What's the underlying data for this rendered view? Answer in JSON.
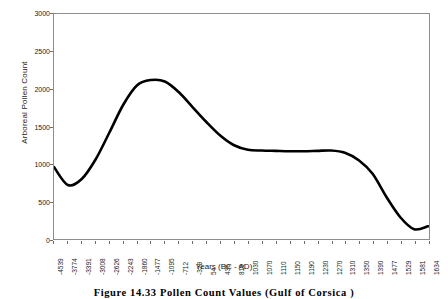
{
  "chart_data": {
    "type": "line",
    "title": "",
    "xlabel": "Years (BC - AD)",
    "ylabel": "Arboreal Pollen Count",
    "ylim": [
      0,
      3000
    ],
    "yticks": [
      0,
      500,
      1000,
      1500,
      2000,
      2500,
      3000
    ],
    "grid": false,
    "legend": "none",
    "categories": [
      "-4539",
      "-3774",
      "-3391",
      "-3008",
      "-2626",
      "-2243",
      "-1860",
      "-1477",
      "-1095",
      "-712",
      "-329",
      "54",
      "436",
      "819",
      "1030",
      "1070",
      "1110",
      "1150",
      "1190",
      "1230",
      "1270",
      "1310",
      "1350",
      "1390",
      "1477",
      "1529",
      "1581",
      "1634"
    ],
    "series": [
      {
        "name": "Arboreal Pollen Count",
        "color": "#000000",
        "values": [
          960,
          720,
          800,
          1060,
          1420,
          1790,
          2050,
          2120,
          2100,
          1960,
          1760,
          1560,
          1380,
          1250,
          1190,
          1180,
          1175,
          1170,
          1170,
          1175,
          1180,
          1150,
          1050,
          870,
          560,
          290,
          130,
          170
        ]
      }
    ]
  },
  "caption": {
    "text": "Figure 14.33   Pollen Count Values (Gulf of Corsica )"
  }
}
